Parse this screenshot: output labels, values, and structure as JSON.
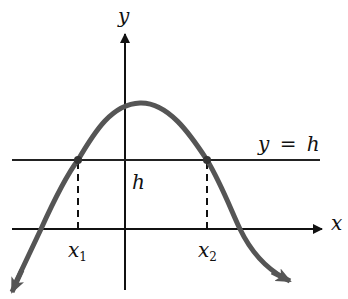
{
  "diagram": {
    "type": "function-graph",
    "colors": {
      "axes": "#111111",
      "curve": "#555555",
      "horizontal_line": "#222222",
      "dashed": "#111111",
      "background": "#ffffff"
    },
    "labels": {
      "y_axis": "y",
      "x_axis": "x",
      "line_label": "y = h",
      "h_label": "h",
      "x1_base": "x",
      "x1_sub": "1",
      "x2_base": "x",
      "x2_sub": "2"
    }
  }
}
